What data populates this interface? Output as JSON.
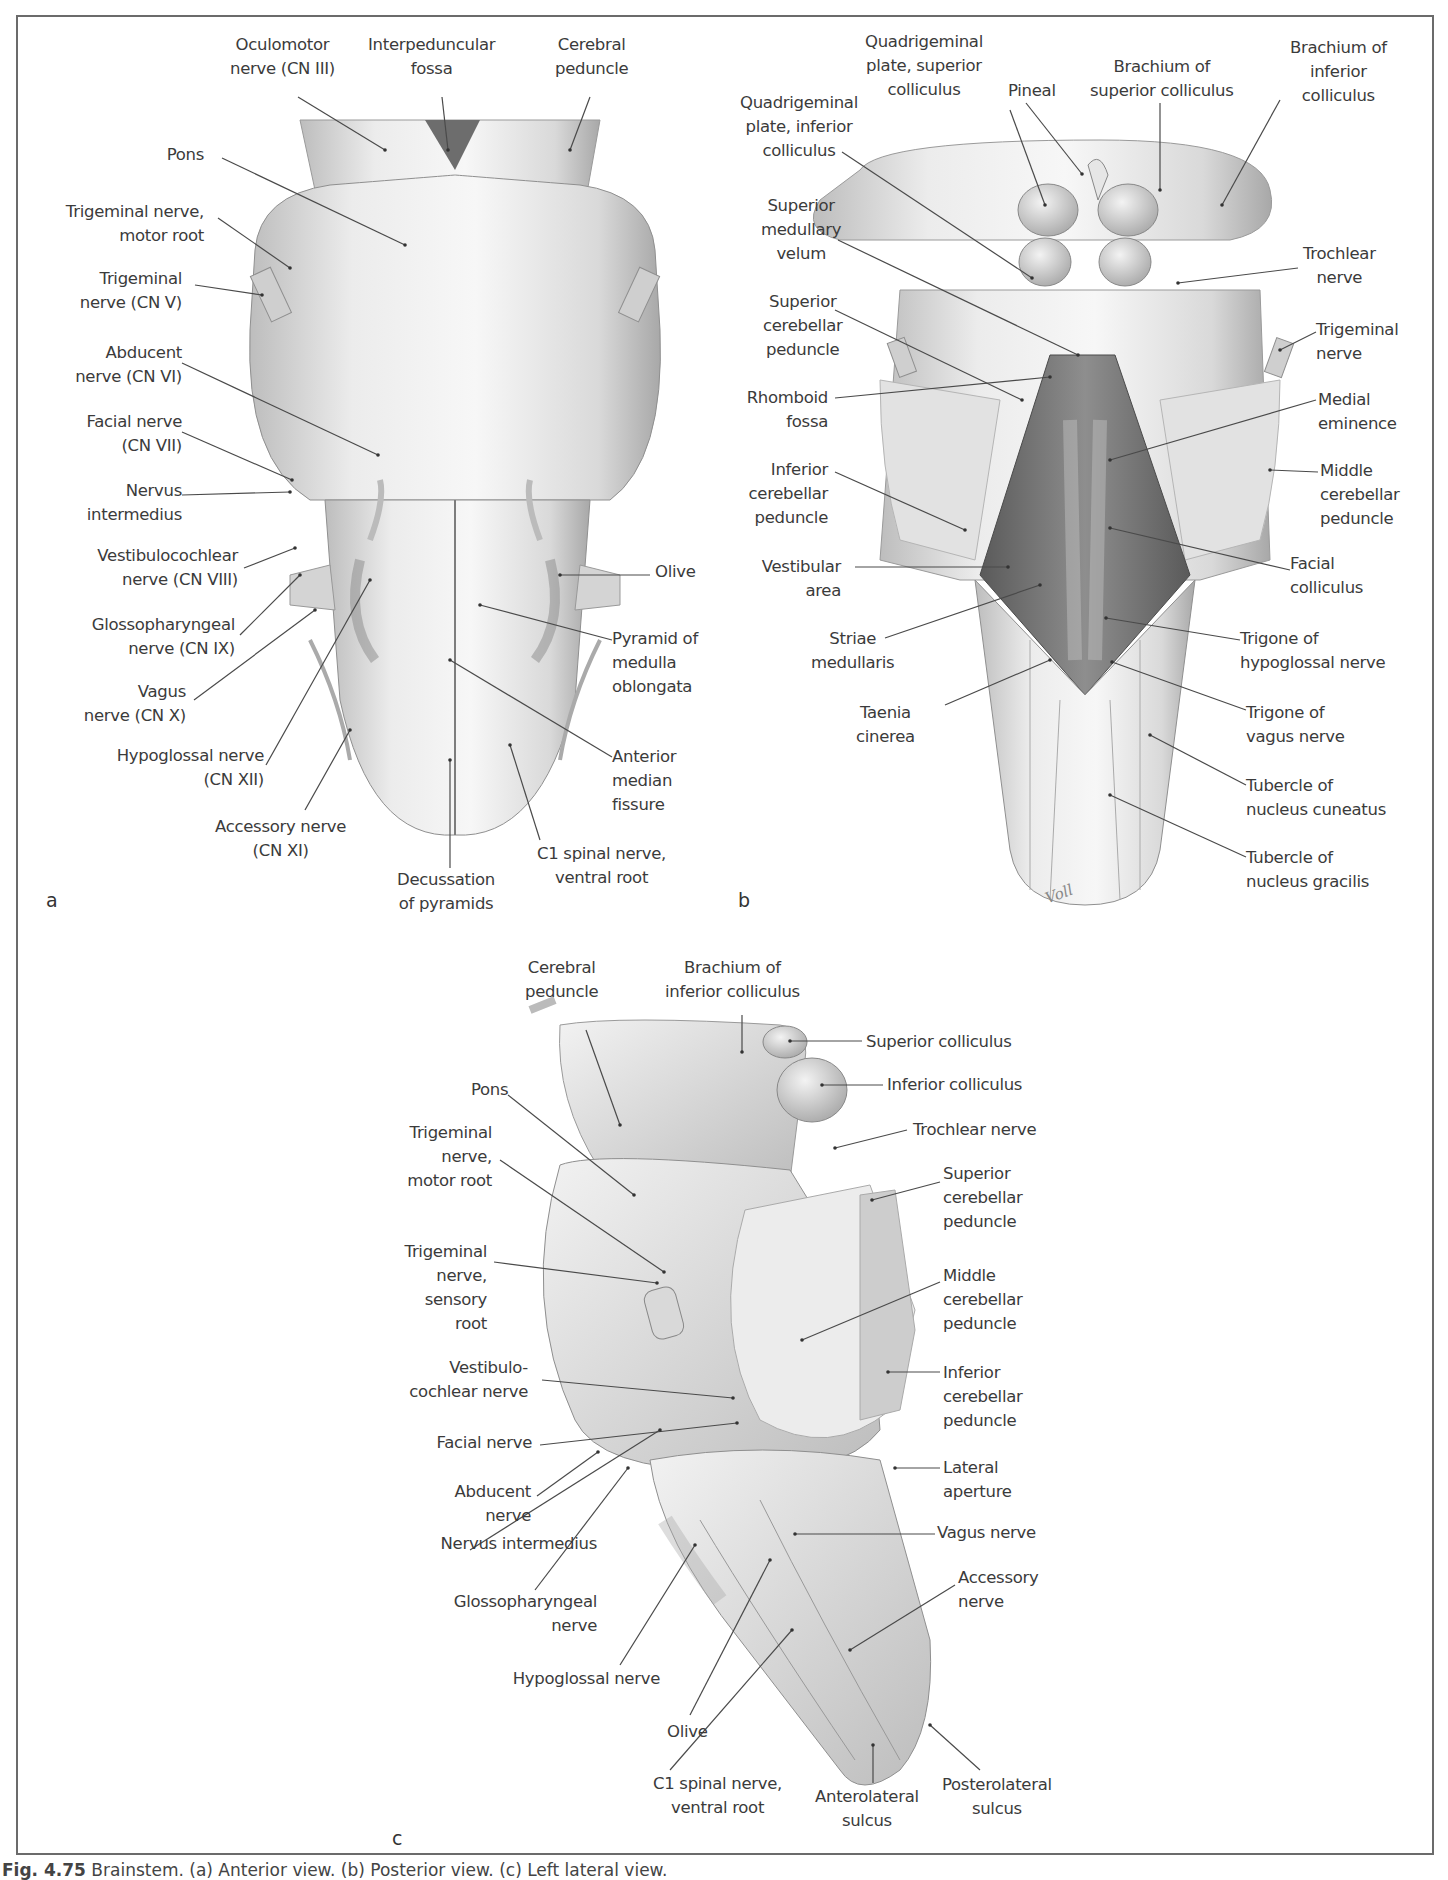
{
  "figure": {
    "caption_label": "Fig. 4.75",
    "caption_text": "Brainstem. (a) Anterior view. (b) Posterior view. (c) Left lateral view.",
    "artist_signature": "Voll"
  },
  "panels": {
    "a": {
      "letter": "a",
      "view": "Anterior view",
      "labels": [
        {
          "id": "oculomotor",
          "text": "Oculomotor\nnerve (CN III)"
        },
        {
          "id": "interpeduncular",
          "text": "Interpeduncular\nfossa"
        },
        {
          "id": "cerebral-peduncle",
          "text": "Cerebral\npeduncle"
        },
        {
          "id": "pons",
          "text": "Pons"
        },
        {
          "id": "trigeminal-motor",
          "text": "Trigeminal nerve,\nmotor root"
        },
        {
          "id": "trigeminal",
          "text": "Trigeminal\nnerve (CN V)"
        },
        {
          "id": "abducent",
          "text": "Abducent\nnerve (CN VI)"
        },
        {
          "id": "facial",
          "text": "Facial nerve\n(CN VII)"
        },
        {
          "id": "nervus-intermedius",
          "text": "Nervus\nintermedius"
        },
        {
          "id": "vestibulocochlear",
          "text": "Vestibulocochlear\nnerve (CN VIII)"
        },
        {
          "id": "glossopharyngeal",
          "text": "Glossopharyngeal\nnerve (CN IX)"
        },
        {
          "id": "vagus",
          "text": "Vagus\nnerve (CN X)"
        },
        {
          "id": "hypoglossal",
          "text": "Hypoglossal nerve\n(CN XII)"
        },
        {
          "id": "accessory",
          "text": "Accessory nerve\n(CN XI)"
        },
        {
          "id": "decussation",
          "text": "Decussation\nof pyramids"
        },
        {
          "id": "c1",
          "text": "C1 spinal nerve,\nventral root"
        },
        {
          "id": "anterior-median-fissure",
          "text": "Anterior\nmedian\nfissure"
        },
        {
          "id": "pyramid",
          "text": "Pyramid of\nmedulla\noblongata"
        },
        {
          "id": "olive",
          "text": "Olive"
        }
      ]
    },
    "b": {
      "letter": "b",
      "view": "Posterior view",
      "labels": [
        {
          "id": "quad-superior",
          "text": "Quadrigeminal\nplate, superior\ncolliculus"
        },
        {
          "id": "pineal",
          "text": "Pineal"
        },
        {
          "id": "brachium-superior",
          "text": "Brachium of\nsuperior colliculus"
        },
        {
          "id": "brachium-inferior",
          "text": "Brachium of\ninferior\ncolliculus"
        },
        {
          "id": "quad-inferior",
          "text": "Quadrigeminal\nplate, inferior\ncolliculus"
        },
        {
          "id": "superior-medullary-velum",
          "text": "Superior\nmedullary\nvelum"
        },
        {
          "id": "trochlear",
          "text": "Trochlear\nnerve"
        },
        {
          "id": "superior-cerebellar-peduncle",
          "text": "Superior\ncerebellar\npeduncle"
        },
        {
          "id": "trigeminal",
          "text": "Trigeminal\nnerve"
        },
        {
          "id": "rhomboid-fossa",
          "text": "Rhomboid\nfossa"
        },
        {
          "id": "medial-eminence",
          "text": "Medial\neminence"
        },
        {
          "id": "inferior-cerebellar-peduncle",
          "text": "Inferior\ncerebellar\npeduncle"
        },
        {
          "id": "middle-cerebellar-peduncle",
          "text": "Middle\ncerebellar\npeduncle"
        },
        {
          "id": "vestibular-area",
          "text": "Vestibular\narea"
        },
        {
          "id": "facial-colliculus",
          "text": "Facial\ncolliculus"
        },
        {
          "id": "striae-medullaris",
          "text": "Striae\nmedullaris"
        },
        {
          "id": "trigone-hypoglossal",
          "text": "Trigone of\nhypoglossal nerve"
        },
        {
          "id": "taenia-cinerea",
          "text": "Taenia\ncinerea"
        },
        {
          "id": "trigone-vagus",
          "text": "Trigone of\nvagus nerve"
        },
        {
          "id": "tubercle-cuneatus",
          "text": "Tubercle of\nnucleus cuneatus"
        },
        {
          "id": "tubercle-gracilis",
          "text": "Tubercle of\nnucleus gracilis"
        }
      ]
    },
    "c": {
      "letter": "c",
      "view": "Left lateral view",
      "labels": [
        {
          "id": "cerebral-peduncle",
          "text": "Cerebral\npeduncle"
        },
        {
          "id": "brachium-inferior",
          "text": "Brachium of\ninferior colliculus"
        },
        {
          "id": "superior-colliculus",
          "text": "Superior colliculus"
        },
        {
          "id": "inferior-colliculus",
          "text": "Inferior colliculus"
        },
        {
          "id": "pons",
          "text": "Pons"
        },
        {
          "id": "trochlear",
          "text": "Trochlear nerve"
        },
        {
          "id": "trigeminal-motor",
          "text": "Trigeminal\nnerve,\nmotor root"
        },
        {
          "id": "superior-cerebellar-peduncle",
          "text": "Superior\ncerebellar\npeduncle"
        },
        {
          "id": "trigeminal-sensory",
          "text": "Trigeminal\nnerve,\nsensory\nroot"
        },
        {
          "id": "middle-cerebellar-peduncle",
          "text": "Middle\ncerebellar\npeduncle"
        },
        {
          "id": "vestibulocochlear",
          "text": "Vestibulo-\ncochlear nerve"
        },
        {
          "id": "inferior-cerebellar-peduncle",
          "text": "Inferior\ncerebellar\npeduncle"
        },
        {
          "id": "facial",
          "text": "Facial nerve"
        },
        {
          "id": "lateral-aperture",
          "text": "Lateral\naperture"
        },
        {
          "id": "abducent",
          "text": "Abducent\nnerve"
        },
        {
          "id": "vagus",
          "text": "Vagus nerve"
        },
        {
          "id": "nervus-intermedius",
          "text": "Nervus intermedius"
        },
        {
          "id": "accessory",
          "text": "Accessory\nnerve"
        },
        {
          "id": "glossopharyngeal",
          "text": "Glossopharyngeal\nnerve"
        },
        {
          "id": "hypoglossal",
          "text": "Hypoglossal nerve"
        },
        {
          "id": "olive",
          "text": "Olive"
        },
        {
          "id": "c1",
          "text": "C1 spinal nerve,\nventral root"
        },
        {
          "id": "anterolateral-sulcus",
          "text": "Anterolateral\nsulcus"
        },
        {
          "id": "posterolateral-sulcus",
          "text": "Posterolateral\nsulcus"
        }
      ]
    }
  }
}
